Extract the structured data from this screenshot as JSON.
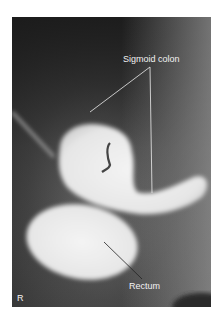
{
  "figure": {
    "type": "radiograph",
    "labels": {
      "sigmoid": "Sigmoid colon",
      "rectum": "Rectum",
      "side_marker": "R"
    }
  }
}
